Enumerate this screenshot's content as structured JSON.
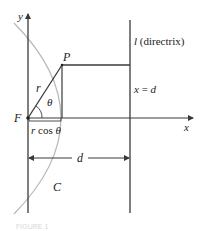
{
  "diagram": {
    "labels": {
      "y_axis": "y",
      "x_axis": "x",
      "point_p": "P",
      "focus_f": "F",
      "radius_r": "r",
      "angle_theta": "θ",
      "r_cos_theta_r": "r",
      "r_cos_theta_cos": " cos ",
      "r_cos_theta_theta": "θ",
      "directrix_l": "l",
      "directrix_text": " (directrix)",
      "x_eq_d_x": "x",
      "x_eq_d_eq": " = ",
      "x_eq_d_d": "d",
      "distance_d": "d",
      "curve_c": "C",
      "caption": "FIGURE 1"
    },
    "colors": {
      "line": "#3a3a3a",
      "curve": "#b8b8b8",
      "caption": "#d8d8d8"
    }
  }
}
